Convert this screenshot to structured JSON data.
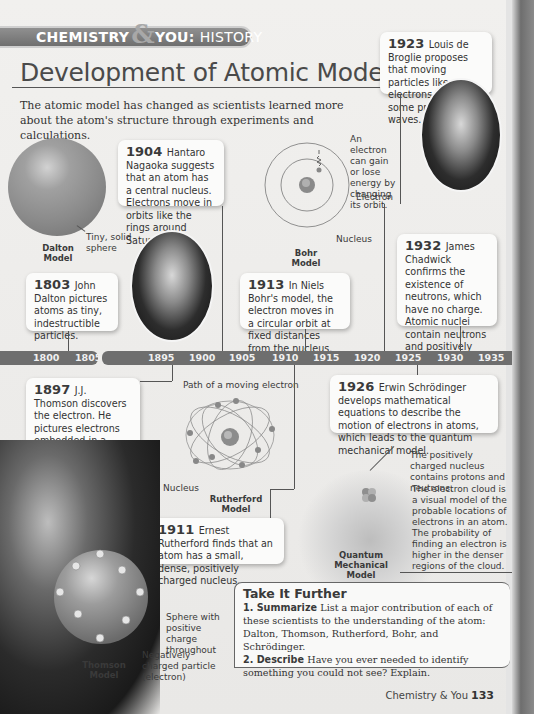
{
  "header": {
    "banner_left": "CHEMISTRY",
    "banner_amp": "&",
    "banner_you": "YOU:",
    "banner_section": "HISTORY",
    "title": "Development of Atomic Models",
    "intro": "The atomic model has changed as scientists learned more about the atom's structure through experiments and calculations."
  },
  "events": [
    {
      "year": "1803",
      "text": "John Dalton pictures atoms as tiny, indestructible particles."
    },
    {
      "year": "1897",
      "text": "J.J. Thomson discovers the electron. He pictures electrons embedded in a sphere of positive electrical charge."
    },
    {
      "year": "1904",
      "text": "Hantaro Nagaoka suggests that an atom has a central nucleus. Electrons move in orbits like the rings around Saturn."
    },
    {
      "year": "1911",
      "text": "Ernest Rutherford finds that an atom has a small, dense, positively charged nucleus."
    },
    {
      "year": "1913",
      "text": "In Niels Bohr's model, the electron moves in a circular orbit at fixed distances from the nucleus."
    },
    {
      "year": "1923",
      "text": "Louis de Broglie proposes that moving particles like electrons have some properties of waves."
    },
    {
      "year": "1926",
      "text": "Erwin Schrödinger develops mathematical equations to describe the motion of electrons in atoms, which leads to the quantum mechanical model."
    },
    {
      "year": "1932",
      "text": "James Chadwick confirms the existence of neutrons, which have no charge. Atomic nuclei contain neutrons and positively charged protons."
    }
  ],
  "timeline": {
    "segment1": [
      "1800",
      "1805"
    ],
    "segment2": [
      "1895",
      "1900",
      "1905",
      "1910",
      "1915",
      "1920",
      "1925",
      "1930",
      "1935"
    ]
  },
  "models": {
    "dalton": {
      "name": "Dalton Model",
      "label": "Tiny, solid sphere"
    },
    "bohr": {
      "name": "Bohr Model",
      "label_energy": "An electron can gain or lose energy by changing its orbit.",
      "label_electron": "Electron",
      "label_nucleus": "Nucleus"
    },
    "rutherford": {
      "name": "Rutherford Model",
      "label_path": "Path of a moving electron",
      "label_nucleus": "Nucleus"
    },
    "quantum": {
      "name": "Quantum Mechanical Model",
      "label_nucleus": "The positively charged nucleus contains protons and neutrons.",
      "label_cloud": "The electron cloud is a visual model of the probable locations of electrons in an atom. The probability of finding an electron is higher in the denser regions of the cloud."
    },
    "thomson": {
      "name": "Thomson Model",
      "label_sphere": "Sphere with positive charge throughout",
      "label_particle": "Negatively charged particle (electron)"
    }
  },
  "take_it_further": {
    "heading": "Take It Further",
    "q1_label": "1. Summarize",
    "q1_text": "List a major contribution of each of these scientists to the understanding of the atom: Dalton, Thomson, Rutherford, Bohr, and Schrödinger.",
    "q2_label": "2. Describe",
    "q2_text": "Have you ever needed to identify something you could not see? Explain."
  },
  "footer": {
    "text": "Chemistry & You",
    "page": "133"
  }
}
